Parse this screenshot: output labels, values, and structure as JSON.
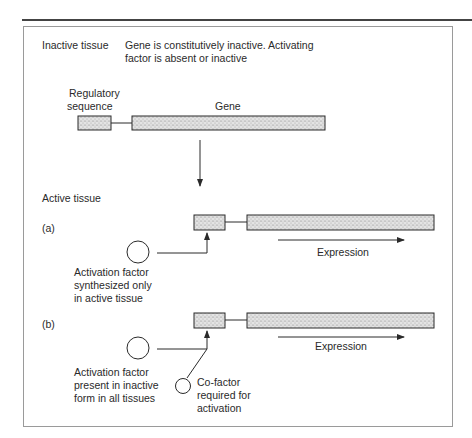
{
  "inactive": {
    "heading": "Inactive tissue",
    "description_line1": "Gene is constitutively inactive. Activating",
    "description_line2": "factor is absent or inactive",
    "reg_label_line1": "Regulatory",
    "reg_label_line2": "sequence",
    "gene_label": "Gene"
  },
  "active": {
    "heading": "Active tissue",
    "a": {
      "label": "(a)",
      "expression_label": "Expression",
      "factor_line1": "Activation factor",
      "factor_line2": "synthesized only",
      "factor_line3": "in active tissue"
    },
    "b": {
      "label": "(b)",
      "expression_label": "Expression",
      "factor_line1": "Activation factor",
      "factor_line2": "present in inactive",
      "factor_line3": "form in all tissues",
      "cofactor_line1": "Co-factor",
      "cofactor_line2": "required for",
      "cofactor_line3": "activation"
    }
  },
  "colors": {
    "stroke": "#2a2a2a",
    "fill_stipple": "#d6d6d6",
    "frame": "#9a9a9a"
  }
}
